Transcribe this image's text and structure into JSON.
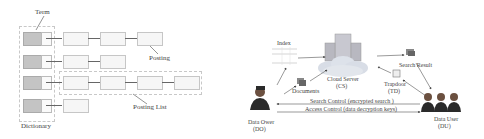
{
  "left_diagram": {
    "title": "Inverted Index structure",
    "labels": {
      "term": "Term",
      "posting": "Posting",
      "posting_list": "Posting List",
      "dictionary": "Dictionary"
    },
    "rows": [
      {
        "postings": 3
      },
      {
        "postings": 2
      },
      {
        "postings": 4
      },
      {
        "postings": 1
      }
    ]
  },
  "right_diagram": {
    "nodes": {
      "index": "Index",
      "cloud_server": "Cloud Server",
      "cloud_server_abbr": "(CS)",
      "documents": "Documents",
      "search_result": "Search Result",
      "trapdoor": "Trapdoor",
      "trapdoor_abbr": "(TD)",
      "data_owner": "Data Ower",
      "data_owner_abbr": "(DO)",
      "data_user": "Data User",
      "data_user_abbr": "(DU)"
    },
    "edges": {
      "search_control": "Search Control (encrypted search )",
      "access_control": "Access Control (data decryption keys)"
    }
  }
}
